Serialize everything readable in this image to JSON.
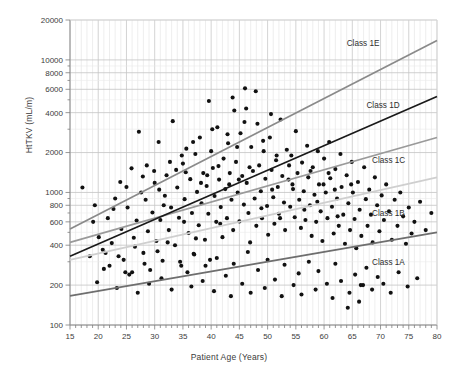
{
  "chart_data": {
    "type": "scatter",
    "title": "",
    "xlabel": "Patient Age (Years)",
    "ylabel": "HtTKV (mL/m)",
    "xlim": [
      15,
      80
    ],
    "ylim": [
      100,
      20000
    ],
    "yscale": "log",
    "xscale": "linear",
    "grid": true,
    "legend_position": "inline-right",
    "xticks": [
      15,
      20,
      25,
      30,
      35,
      40,
      45,
      50,
      55,
      60,
      65,
      70,
      75,
      80
    ],
    "xticklabels": [
      "15",
      "20",
      "25",
      "30",
      "35",
      "40",
      "45",
      "50",
      "55",
      "60",
      "65",
      "70",
      "75",
      "80"
    ],
    "x_minor_tick_step": 1,
    "yticks": [
      100,
      200,
      400,
      600,
      800,
      1000,
      2000,
      4000,
      6000,
      8000,
      10000,
      20000
    ],
    "yticklabels": [
      "100",
      "200",
      "400",
      "600",
      "800",
      "1000",
      "2000",
      "4000",
      "6000",
      "8000",
      "10000",
      "20000"
    ],
    "series": [
      {
        "name": "Class 1A",
        "type": "line",
        "color": "#6e6e6e",
        "label": "Class 1A",
        "label_x": 68.5,
        "label_y": 300,
        "x": [
          15,
          80
        ],
        "y": [
          166,
          500
        ]
      },
      {
        "name": "Class 1B",
        "type": "line",
        "color": "#cfcfcf",
        "label": "Class 1B",
        "label_x": 68.5,
        "label_y": 700,
        "x": [
          15,
          80
        ],
        "y": [
          310,
          1300
        ]
      },
      {
        "name": "Class 1C",
        "type": "line",
        "color": "#9a9a9a",
        "label": "Class 1C",
        "label_x": 68.5,
        "label_y": 1750,
        "x": [
          15,
          80
        ],
        "y": [
          420,
          2600
        ]
      },
      {
        "name": "Class 1D",
        "type": "line",
        "color": "#1a1a1a",
        "label": "Class 1D",
        "label_x": 67.5,
        "label_y": 4600,
        "x": [
          15,
          80
        ],
        "y": [
          330,
          5300
        ]
      },
      {
        "name": "Class 1E",
        "type": "line",
        "color": "#8a8a8a",
        "label": "Class 1E",
        "label_x": 64.0,
        "label_y": 13500,
        "x": [
          15,
          80
        ],
        "y": [
          530,
          14000
        ]
      },
      {
        "name": "Patients",
        "type": "scatter",
        "color": "#111111",
        "marker": "circle",
        "marker_size": 4,
        "points": [
          [
            17.2,
            1090
          ],
          [
            19.4,
            800
          ],
          [
            20.1,
            460
          ],
          [
            21.0,
            265
          ],
          [
            21.7,
            640
          ],
          [
            22.4,
            415
          ],
          [
            23.0,
            900
          ],
          [
            23.6,
            330
          ],
          [
            24.1,
            530
          ],
          [
            24.8,
            250
          ],
          [
            25.2,
            770
          ],
          [
            25.9,
            1520
          ],
          [
            26.3,
            455
          ],
          [
            26.8,
            615
          ],
          [
            27.2,
            2870
          ],
          [
            27.6,
            1000
          ],
          [
            28.0,
            350
          ],
          [
            28.4,
            880
          ],
          [
            28.8,
            510
          ],
          [
            29.2,
            260
          ],
          [
            29.6,
            705
          ],
          [
            30.0,
            1180
          ],
          [
            30.3,
            430
          ],
          [
            30.7,
            2400
          ],
          [
            31.0,
            620
          ],
          [
            31.4,
            305
          ],
          [
            31.8,
            945
          ],
          [
            32.1,
            1350
          ],
          [
            32.5,
            520
          ],
          [
            32.9,
            770
          ],
          [
            33.2,
            3450
          ],
          [
            33.6,
            400
          ],
          [
            34.0,
            1090
          ],
          [
            34.3,
            645
          ],
          [
            34.7,
            280
          ],
          [
            35.0,
            1650
          ],
          [
            35.3,
            890
          ],
          [
            35.6,
            2140
          ],
          [
            36.0,
            495
          ],
          [
            36.3,
            1260
          ],
          [
            36.6,
            700
          ],
          [
            36.9,
            345
          ],
          [
            37.2,
            1950
          ],
          [
            37.5,
            1010
          ],
          [
            37.8,
            565
          ],
          [
            38.0,
            2600
          ],
          [
            38.3,
            830
          ],
          [
            38.6,
            1400
          ],
          [
            38.9,
            440
          ],
          [
            39.2,
            1120
          ],
          [
            39.5,
            690
          ],
          [
            39.8,
            310
          ],
          [
            40.0,
            2050
          ],
          [
            40.3,
            1530
          ],
          [
            40.6,
            940
          ],
          [
            40.9,
            600
          ],
          [
            41.1,
            3100
          ],
          [
            41.4,
            1250
          ],
          [
            41.7,
            775
          ],
          [
            42.0,
            460
          ],
          [
            42.2,
            1800
          ],
          [
            42.5,
            1060
          ],
          [
            42.8,
            640
          ],
          [
            43.0,
            2350
          ],
          [
            43.3,
            1400
          ],
          [
            43.6,
            880
          ],
          [
            43.9,
            520
          ],
          [
            44.1,
            4150
          ],
          [
            44.4,
            1700
          ],
          [
            44.7,
            1000
          ],
          [
            45.0,
            605
          ],
          [
            45.2,
            2800
          ],
          [
            45.5,
            1330
          ],
          [
            45.8,
            810
          ],
          [
            46.0,
            6100
          ],
          [
            46.3,
            1180
          ],
          [
            46.6,
            700
          ],
          [
            46.9,
            420
          ],
          [
            47.1,
            2200
          ],
          [
            47.4,
            1450
          ],
          [
            47.7,
            900
          ],
          [
            48.0,
            560
          ],
          [
            48.2,
            3300
          ],
          [
            48.5,
            1600
          ],
          [
            48.8,
            1020
          ],
          [
            49.0,
            640
          ],
          [
            49.3,
            2050
          ],
          [
            49.6,
            1270
          ],
          [
            49.9,
            790
          ],
          [
            50.1,
            480
          ],
          [
            50.4,
            2600
          ],
          [
            50.7,
            1480
          ],
          [
            51.0,
            920
          ],
          [
            51.2,
            580
          ],
          [
            51.5,
            1750
          ],
          [
            51.8,
            1100
          ],
          [
            52.0,
            690
          ],
          [
            52.3,
            3550
          ],
          [
            52.6,
            1330
          ],
          [
            52.9,
            840
          ],
          [
            53.1,
            520
          ],
          [
            53.4,
            2100
          ],
          [
            53.7,
            1250
          ],
          [
            54.0,
            780
          ],
          [
            54.2,
            1900
          ],
          [
            54.5,
            1060
          ],
          [
            54.8,
            650
          ],
          [
            55.0,
            2900
          ],
          [
            55.3,
            1400
          ],
          [
            55.6,
            880
          ],
          [
            55.9,
            540
          ],
          [
            56.1,
            1680
          ],
          [
            56.4,
            1020
          ],
          [
            56.7,
            620
          ],
          [
            57.0,
            2250
          ],
          [
            57.2,
            1300
          ],
          [
            57.5,
            800
          ],
          [
            57.8,
            470
          ],
          [
            58.0,
            1550
          ],
          [
            58.3,
            960
          ],
          [
            58.6,
            600
          ],
          [
            58.9,
            2050
          ],
          [
            59.1,
            1150
          ],
          [
            59.4,
            720
          ],
          [
            59.7,
            430
          ],
          [
            60.0,
            1800
          ],
          [
            60.3,
            1000
          ],
          [
            60.6,
            640
          ],
          [
            60.9,
            2400
          ],
          [
            61.1,
            1280
          ],
          [
            61.4,
            780
          ],
          [
            61.7,
            490
          ],
          [
            62.0,
            1500
          ],
          [
            62.3,
            900
          ],
          [
            62.6,
            560
          ],
          [
            62.9,
            1950
          ],
          [
            63.1,
            1100
          ],
          [
            63.4,
            680
          ],
          [
            63.7,
            410
          ],
          [
            64.0,
            1350
          ],
          [
            64.3,
            830
          ],
          [
            64.6,
            520
          ],
          [
            64.9,
            1700
          ],
          [
            65.1,
            1000
          ],
          [
            65.4,
            630
          ],
          [
            65.7,
            380
          ],
          [
            66.0,
            1200
          ],
          [
            66.3,
            740
          ],
          [
            66.6,
            470
          ],
          [
            66.9,
            200
          ],
          [
            67.1,
            1550
          ],
          [
            67.4,
            890
          ],
          [
            67.7,
            560
          ],
          [
            68.0,
            1050
          ],
          [
            68.3,
            680
          ],
          [
            68.6,
            420
          ],
          [
            69.0,
            1300
          ],
          [
            69.4,
            800
          ],
          [
            69.8,
            510
          ],
          [
            70.2,
            950
          ],
          [
            70.6,
            620
          ],
          [
            71.0,
            1150
          ],
          [
            71.5,
            720
          ],
          [
            72.0,
            440
          ],
          [
            72.5,
            880
          ],
          [
            73.0,
            560
          ],
          [
            73.5,
            1000
          ],
          [
            74.0,
            660
          ],
          [
            74.5,
            410
          ],
          [
            75.0,
            770
          ],
          [
            75.5,
            490
          ],
          [
            76.0,
            600
          ],
          [
            77.0,
            850
          ],
          [
            78.0,
            520
          ],
          [
            79.0,
            700
          ],
          [
            18.5,
            330
          ],
          [
            19.8,
            210
          ],
          [
            20.8,
            370
          ],
          [
            22.0,
            280
          ],
          [
            23.3,
            190
          ],
          [
            24.5,
            310
          ],
          [
            25.5,
            240
          ],
          [
            26.5,
            390
          ],
          [
            27.0,
            175
          ],
          [
            28.2,
            290
          ],
          [
            29.0,
            205
          ],
          [
            30.5,
            360
          ],
          [
            31.2,
            225
          ],
          [
            32.3,
            420
          ],
          [
            33.0,
            185
          ],
          [
            34.5,
            300
          ],
          [
            35.8,
            250
          ],
          [
            36.5,
            195
          ],
          [
            37.0,
            340
          ],
          [
            38.5,
            215
          ],
          [
            39.0,
            280
          ],
          [
            40.5,
            180
          ],
          [
            41.0,
            320
          ],
          [
            42.6,
            235
          ],
          [
            43.5,
            165
          ],
          [
            44.0,
            290
          ],
          [
            45.5,
            205
          ],
          [
            46.5,
            355
          ],
          [
            47.0,
            175
          ],
          [
            48.3,
            260
          ],
          [
            49.5,
            190
          ],
          [
            50.0,
            310
          ],
          [
            51.3,
            220
          ],
          [
            52.5,
            165
          ],
          [
            53.0,
            285
          ],
          [
            54.6,
            200
          ],
          [
            55.5,
            245
          ],
          [
            56.0,
            170
          ],
          [
            57.3,
            300
          ],
          [
            58.5,
            185
          ],
          [
            59.0,
            255
          ],
          [
            60.5,
            205
          ],
          [
            61.5,
            160
          ],
          [
            62.0,
            290
          ],
          [
            63.0,
            215
          ],
          [
            64.5,
            175
          ],
          [
            65.5,
            240
          ],
          [
            66.5,
            200
          ],
          [
            67.5,
            270
          ],
          [
            68.5,
            185
          ],
          [
            69.5,
            230
          ],
          [
            70.5,
            205
          ],
          [
            71.8,
            175
          ],
          [
            73.2,
            250
          ],
          [
            74.8,
            195
          ],
          [
            76.5,
            225
          ],
          [
            64.2,
            135
          ],
          [
            66.2,
            150
          ],
          [
            30.8,
            1050
          ],
          [
            33.8,
            1480
          ],
          [
            35.2,
            600
          ],
          [
            37.3,
            450
          ],
          [
            39.3,
            1350
          ],
          [
            41.6,
            580
          ],
          [
            43.2,
            1150
          ],
          [
            44.9,
            1250
          ],
          [
            46.8,
            1550
          ],
          [
            48.9,
            760
          ],
          [
            50.8,
            1050
          ],
          [
            52.2,
            640
          ],
          [
            54.4,
            1150
          ],
          [
            56.5,
            740
          ],
          [
            58.8,
            850
          ],
          [
            60.8,
            1400
          ],
          [
            62.4,
            660
          ],
          [
            64.8,
            1150
          ],
          [
            19.1,
            600
          ],
          [
            21.3,
            350
          ],
          [
            23.9,
            1200
          ],
          [
            26.0,
            250
          ],
          [
            28.6,
            1600
          ],
          [
            31.6,
            800
          ],
          [
            34.8,
            1900
          ],
          [
            36.8,
            2400
          ],
          [
            40.2,
            3000
          ],
          [
            42.9,
            2750
          ],
          [
            45.9,
            3400
          ],
          [
            49.2,
            2450
          ],
          [
            51.6,
            1900
          ],
          [
            53.8,
            1600
          ],
          [
            57.6,
            1450
          ],
          [
            59.9,
            1150
          ],
          [
            61.9,
            1050
          ],
          [
            39.6,
            4900
          ],
          [
            43.8,
            5200
          ],
          [
            46.2,
            4300
          ],
          [
            50.6,
            3900
          ],
          [
            47.9,
            5800
          ],
          [
            44.6,
            2200
          ],
          [
            41.3,
            1580
          ],
          [
            38.2,
            1180
          ],
          [
            35.5,
            1420
          ],
          [
            32.7,
            1700
          ],
          [
            29.9,
            1450
          ],
          [
            27.9,
            1320
          ],
          [
            25.0,
            1100
          ],
          [
            22.7,
            750
          ]
        ]
      }
    ]
  }
}
